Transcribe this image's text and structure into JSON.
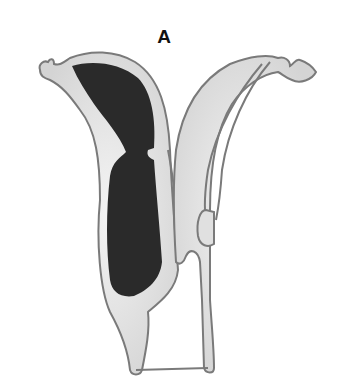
{
  "figure": {
    "label": "A",
    "colors": {
      "wall_fill": "#e6e6e6",
      "wall_stroke": "#7a7a7a",
      "cavity_fill": "#2a2a2a",
      "background": "#ffffff"
    }
  }
}
